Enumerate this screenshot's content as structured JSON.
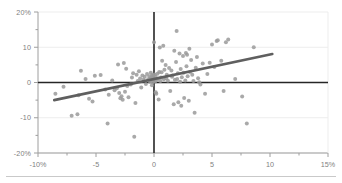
{
  "chart_data": {
    "type": "scatter",
    "title": "",
    "xlabel": "",
    "ylabel": "",
    "xlim": [
      -10,
      15
    ],
    "ylim": [
      -20,
      20
    ],
    "grid": true,
    "legend": "none",
    "x_ticks": [
      -10,
      -5,
      0,
      5,
      10,
      15
    ],
    "x_tick_labels": [
      "-10%",
      "-5",
      "0",
      "5",
      "10",
      "15%"
    ],
    "y_ticks": [
      20,
      10,
      0,
      -10,
      -20
    ],
    "y_tick_labels": [
      "20%",
      "10",
      "0",
      "-10",
      "-20%"
    ],
    "x_minor_step": 2.5,
    "y_minor_step": 5,
    "zero_lines": {
      "horizontal_y": 0,
      "vertical_x": 0
    },
    "point_color": "#9a9a9a",
    "line_color": "#5f5f5f",
    "axis_color": "#9e9e9e",
    "grid_color": "#ededed",
    "zero_line_color": "#262626",
    "point_radius": 2.0,
    "trendline": {
      "type": "linear",
      "x_start": -8.6,
      "y_start": -5.0,
      "x_end": 10.2,
      "y_end": 8.1,
      "width": 2.6
    },
    "series": [
      {
        "name": "observations",
        "points": [
          [
            -8.5,
            -3.2
          ],
          [
            -7.8,
            -1.2
          ],
          [
            -7.1,
            -9.4
          ],
          [
            -6.6,
            -9.0
          ],
          [
            -6.5,
            -3.6
          ],
          [
            -6.3,
            3.3
          ],
          [
            -5.9,
            1.0
          ],
          [
            -5.6,
            -4.6
          ],
          [
            -5.3,
            -5.4
          ],
          [
            -5.1,
            1.9
          ],
          [
            -4.6,
            2.1
          ],
          [
            -4.2,
            -2.0
          ],
          [
            -4.0,
            -11.6
          ],
          [
            -3.9,
            -3.5
          ],
          [
            -3.6,
            0.6
          ],
          [
            -3.4,
            -2.2
          ],
          [
            -3.2,
            -1.6
          ],
          [
            -3.1,
            5.1
          ],
          [
            -3.0,
            -3.0
          ],
          [
            -2.9,
            -4.5
          ],
          [
            -2.8,
            -3.9
          ],
          [
            -2.7,
            -4.9
          ],
          [
            -2.6,
            5.5
          ],
          [
            -2.5,
            -2.6
          ],
          [
            -2.4,
            3.9
          ],
          [
            -2.3,
            -1.0
          ],
          [
            -2.2,
            -4.2
          ],
          [
            -2.0,
            -0.6
          ],
          [
            -1.9,
            1.4
          ],
          [
            -1.8,
            2.6
          ],
          [
            -1.7,
            -15.4
          ],
          [
            -1.6,
            -5.8
          ],
          [
            -1.5,
            2.2
          ],
          [
            -1.4,
            0.4
          ],
          [
            -1.3,
            3.2
          ],
          [
            -1.2,
            1.1
          ],
          [
            -1.1,
            -1.4
          ],
          [
            -1.0,
            2.0
          ],
          [
            -0.9,
            0.8
          ],
          [
            -0.8,
            1.6
          ],
          [
            -0.7,
            -0.4
          ],
          [
            -0.6,
            2.4
          ],
          [
            -0.5,
            0.9
          ],
          [
            -0.4,
            1.8
          ],
          [
            -0.35,
            0.2
          ],
          [
            -0.3,
            1.2
          ],
          [
            -0.28,
            2.8
          ],
          [
            -0.25,
            0.5
          ],
          [
            -0.2,
            1.5
          ],
          [
            -0.18,
            -0.8
          ],
          [
            -0.15,
            2.1
          ],
          [
            -0.12,
            0.1
          ],
          [
            -0.1,
            1.0
          ],
          [
            -0.08,
            1.9
          ],
          [
            -0.05,
            0.6
          ],
          [
            -0.02,
            1.3
          ],
          [
            0.0,
            11.4
          ],
          [
            0.05,
            2.3
          ],
          [
            0.1,
            0.3
          ],
          [
            0.12,
            1.7
          ],
          [
            0.15,
            -2.8
          ],
          [
            0.2,
            -3.2
          ],
          [
            0.25,
            0.7
          ],
          [
            0.3,
            2.5
          ],
          [
            0.35,
            1.1
          ],
          [
            0.4,
            -4.8
          ],
          [
            0.45,
            3.0
          ],
          [
            0.5,
            9.9
          ],
          [
            0.55,
            0.4
          ],
          [
            0.6,
            1.4
          ],
          [
            0.65,
            2.9
          ],
          [
            0.7,
            6.2
          ],
          [
            0.8,
            10.4
          ],
          [
            0.85,
            0.9
          ],
          [
            0.9,
            3.6
          ],
          [
            1.0,
            5.0
          ],
          [
            1.05,
            1.2
          ],
          [
            1.1,
            2.2
          ],
          [
            1.2,
            0.5
          ],
          [
            1.3,
            4.1
          ],
          [
            1.4,
            -2.4
          ],
          [
            1.5,
            3.4
          ],
          [
            1.55,
            1.6
          ],
          [
            1.6,
            2.0
          ],
          [
            1.7,
            -6.2
          ],
          [
            1.75,
            9.0
          ],
          [
            1.8,
            0.8
          ],
          [
            1.9,
            5.8
          ],
          [
            1.95,
            14.6
          ],
          [
            2.0,
            1.0
          ],
          [
            2.05,
            2.6
          ],
          [
            2.1,
            -5.6
          ],
          [
            2.2,
            8.2
          ],
          [
            2.25,
            0.2
          ],
          [
            2.3,
            3.8
          ],
          [
            2.35,
            -6.6
          ],
          [
            2.4,
            1.5
          ],
          [
            2.5,
            7.5
          ],
          [
            2.55,
            2.8
          ],
          [
            2.6,
            -4.4
          ],
          [
            2.7,
            0.6
          ],
          [
            2.75,
            8.4
          ],
          [
            2.8,
            4.6
          ],
          [
            2.85,
            7.9
          ],
          [
            2.9,
            1.8
          ],
          [
            3.0,
            -5.2
          ],
          [
            3.05,
            9.6
          ],
          [
            3.1,
            3.0
          ],
          [
            3.2,
            6.4
          ],
          [
            3.3,
            2.2
          ],
          [
            3.4,
            0.4
          ],
          [
            3.5,
            -8.6
          ],
          [
            3.6,
            4.2
          ],
          [
            3.7,
            7.2
          ],
          [
            3.8,
            1.2
          ],
          [
            3.9,
            0.1
          ],
          [
            4.0,
            -0.6
          ],
          [
            4.2,
            5.4
          ],
          [
            4.4,
            -3.2
          ],
          [
            4.6,
            2.4
          ],
          [
            4.8,
            5.6
          ],
          [
            5.0,
            10.8
          ],
          [
            5.2,
            4.4
          ],
          [
            5.4,
            11.8
          ],
          [
            5.5,
            12.0
          ],
          [
            5.8,
            6.2
          ],
          [
            6.0,
            -2.4
          ],
          [
            6.2,
            11.4
          ],
          [
            6.4,
            12.2
          ],
          [
            7.0,
            1.0
          ],
          [
            7.6,
            -4.0
          ],
          [
            8.0,
            -11.6
          ],
          [
            8.6,
            10.0
          ]
        ]
      }
    ]
  },
  "axis_labels": {
    "x": [
      "-10%",
      "-5",
      "0",
      "5",
      "10",
      "15%"
    ],
    "y": [
      "20%",
      "10",
      "0",
      "-10",
      "-20%"
    ]
  }
}
